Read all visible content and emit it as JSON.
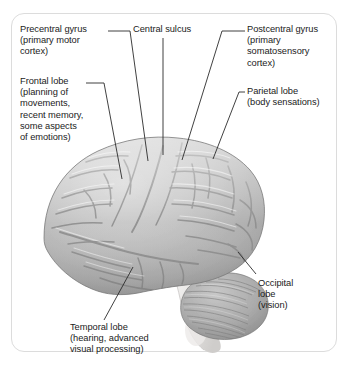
{
  "figure": {
    "background_color": "#ffffff",
    "frame_border_color": "#dcdcdc",
    "text_color": "#1b1b1b",
    "leader_line_color": "#2b2b2b",
    "brain_fill_color": "#b6b6b6",
    "brain_sulci_color": "#8a8a8a",
    "brainstem_color": "#e6e4e2"
  },
  "labels": {
    "precentral_gyrus": "Precentral gyrus\n(primary motor\ncortex)",
    "frontal_lobe": "Frontal lobe\n(planning of\nmovements,\nrecent memory,\nsome aspects\nof emotions)",
    "central_sulcus": "Central sulcus",
    "postcentral_gyrus": "Postcentral gyrus\n(primary\nsomatosensory\ncortex)",
    "parietal_lobe": "Parietal lobe\n(body sensations)",
    "occipital_lobe": "Occipital\nlobe\n(vision)",
    "temporal_lobe": "Temporal lobe\n(hearing, advanced\nvisual processing)"
  },
  "structures": {
    "cerebrum": "cerebrum",
    "cerebellum": "cerebellum",
    "brainstem": "brainstem"
  }
}
